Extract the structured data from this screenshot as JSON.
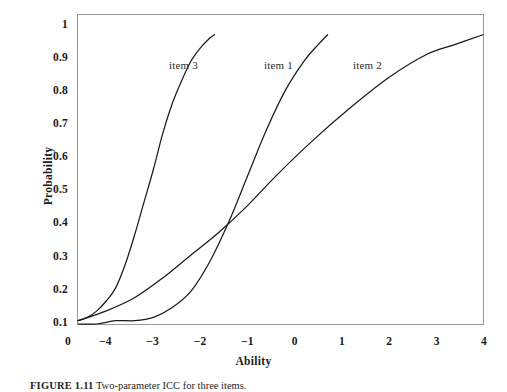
{
  "figure": {
    "caption_number": "FIGURE 1.11",
    "caption_text": "Two-parameter ICC for three items."
  },
  "chart_data": {
    "type": "line",
    "title": "",
    "xlabel": "Ability",
    "ylabel": "Probability",
    "xlim": [
      -4.6,
      4.0
    ],
    "ylim": [
      0.09,
      1.03
    ],
    "grid": false,
    "legend_position": "inline-annotations",
    "x_tick_labels": [
      "0",
      "−4",
      "−3",
      "−2",
      "−1",
      "0",
      "1",
      "2",
      "3",
      "4"
    ],
    "x_tick_values": [
      null,
      -4,
      -3,
      -2,
      -1,
      0,
      1,
      2,
      3,
      4
    ],
    "y_tick_labels": [
      "0.1",
      "0.2",
      "0.3",
      "0.4",
      "0.5",
      "0.6",
      "0.7",
      "0.8",
      "0.9",
      "1"
    ],
    "y_tick_values": [
      0.1,
      0.2,
      0.3,
      0.4,
      0.5,
      0.6,
      0.7,
      0.8,
      0.9,
      1.0
    ],
    "line_color": "#1a1a1a",
    "series": [
      {
        "name": "item 3",
        "label": "item 3",
        "discrimination": 1.9,
        "difficulty": -3.05,
        "guessing": 0.09,
        "x": [
          -4.6,
          -4.4,
          -4.2,
          -4.0,
          -3.8,
          -3.6,
          -3.4,
          -3.2,
          -3.0,
          -2.8,
          -2.6,
          -2.4,
          -2.2,
          -2.0,
          -1.8,
          -1.7
        ],
        "y": [
          0.1,
          0.11,
          0.13,
          0.16,
          0.2,
          0.27,
          0.36,
          0.46,
          0.56,
          0.67,
          0.76,
          0.83,
          0.89,
          0.93,
          0.96,
          0.97
        ]
      },
      {
        "name": "item 1",
        "label": "item 1",
        "discrimination": 2.0,
        "difficulty": -1.0,
        "guessing": 0.09,
        "x": [
          -4.6,
          -4.2,
          -3.8,
          -3.4,
          -3.0,
          -2.6,
          -2.2,
          -1.8,
          -1.4,
          -1.0,
          -0.6,
          -0.2,
          0.2,
          0.5,
          0.7
        ],
        "y": [
          0.09,
          0.09,
          0.1,
          0.1,
          0.11,
          0.14,
          0.19,
          0.28,
          0.4,
          0.54,
          0.68,
          0.8,
          0.89,
          0.94,
          0.97
        ]
      },
      {
        "name": "item 2",
        "label": "item 2",
        "discrimination": 0.62,
        "difficulty": -1.0,
        "guessing": 0.09,
        "x": [
          -4.6,
          -4.0,
          -3.4,
          -2.8,
          -2.2,
          -1.6,
          -1.0,
          -0.4,
          0.4,
          1.2,
          2.0,
          2.8,
          3.4,
          4.0
        ],
        "y": [
          0.1,
          0.13,
          0.17,
          0.23,
          0.3,
          0.37,
          0.45,
          0.54,
          0.65,
          0.75,
          0.84,
          0.91,
          0.94,
          0.97
        ]
      }
    ],
    "annotations": [
      {
        "text": "item 3",
        "x_px": 168,
        "y_px": 64
      },
      {
        "text": "item 1",
        "x_px": 263,
        "y_px": 64
      },
      {
        "text": "item 2",
        "x_px": 352,
        "y_px": 64
      }
    ]
  }
}
